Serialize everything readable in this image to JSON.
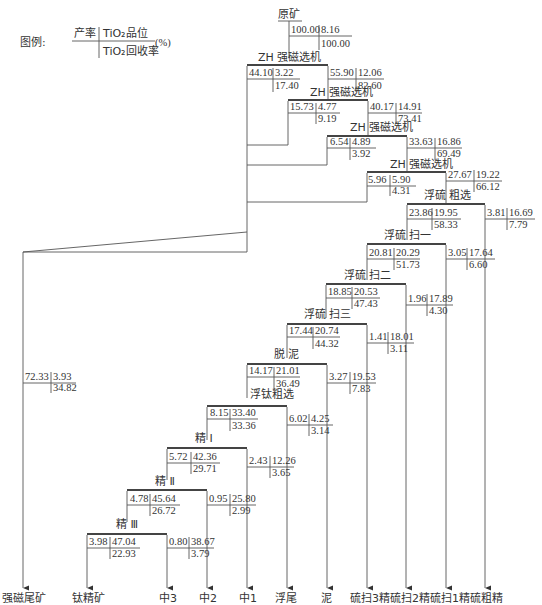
{
  "legend": {
    "prefix": "图例:",
    "yield_label": "产率",
    "grade_label": "TiO₂品位",
    "recovery_label": "TiO₂回收率",
    "unit": "(%)"
  },
  "feed": {
    "label": "原矿",
    "yield": "100.00",
    "grade": "8.16",
    "recovery": "100.00"
  },
  "operations": [
    {
      "id": "mag1",
      "label": "ZH  强磁选机"
    },
    {
      "id": "mag2",
      "label": "ZH  强磁选机"
    },
    {
      "id": "mag3",
      "label": "ZH  强磁选机"
    },
    {
      "id": "mag4",
      "label": "ZH  强磁选机"
    },
    {
      "id": "s_rough",
      "label": "浮硫  粗选"
    },
    {
      "id": "s_scav1",
      "label": "浮硫  扫一"
    },
    {
      "id": "s_scav2",
      "label": "浮硫  扫二"
    },
    {
      "id": "s_scav3",
      "label": "浮硫  扫三"
    },
    {
      "id": "deslime",
      "label": "脱  泥"
    },
    {
      "id": "ti_rough",
      "label": "浮钛粗选"
    },
    {
      "id": "clean1",
      "label": "精  Ⅰ"
    },
    {
      "id": "clean2",
      "label": "精  Ⅱ"
    },
    {
      "id": "clean3",
      "label": "精  Ⅲ"
    }
  ],
  "nodes": [
    {
      "id": "mag1_tail",
      "yield": "44.10",
      "grade": "3.22",
      "recovery": "17.40"
    },
    {
      "id": "mag1_conc",
      "yield": "55.90",
      "grade": "12.06",
      "recovery": "82.60"
    },
    {
      "id": "mag2_tail",
      "yield": "15.73",
      "grade": "4.77",
      "recovery": "9.19"
    },
    {
      "id": "mag2_conc",
      "yield": "40.17",
      "grade": "14.91",
      "recovery": "73.41"
    },
    {
      "id": "mag3_tail",
      "yield": "6.54",
      "grade": "4.89",
      "recovery": "3.92"
    },
    {
      "id": "mag3_conc",
      "yield": "33.63",
      "grade": "16.86",
      "recovery": "69.49"
    },
    {
      "id": "mag4_tail",
      "yield": "5.96",
      "grade": "5.90",
      "recovery": "4.31"
    },
    {
      "id": "mag4_conc",
      "yield": "27.67",
      "grade": "19.22",
      "recovery": "66.12"
    },
    {
      "id": "s_rough_tail",
      "yield": "23.86",
      "grade": "19.95",
      "recovery": "58.33"
    },
    {
      "id": "s_rough_conc",
      "yield": "3.81",
      "grade": "16.69",
      "recovery": "7.79"
    },
    {
      "id": "s_scav1_tail",
      "yield": "20.81",
      "grade": "20.29",
      "recovery": "51.73"
    },
    {
      "id": "s_scav1_conc",
      "yield": "3.05",
      "grade": "17.64",
      "recovery": "6.60"
    },
    {
      "id": "s_scav2_tail",
      "yield": "18.85",
      "grade": "20.53",
      "recovery": "47.43"
    },
    {
      "id": "s_scav2_conc",
      "yield": "1.96",
      "grade": "17.89",
      "recovery": "4.30"
    },
    {
      "id": "s_scav3_tail",
      "yield": "17.44",
      "grade": "20.74",
      "recovery": "44.32"
    },
    {
      "id": "s_scav3_conc",
      "yield": "1.41",
      "grade": "18.01",
      "recovery": "3.11"
    },
    {
      "id": "deslime_under",
      "yield": "14.17",
      "grade": "21.01",
      "recovery": "36.49"
    },
    {
      "id": "deslime_slime",
      "yield": "3.27",
      "grade": "19.53",
      "recovery": "7.83"
    },
    {
      "id": "ti_rough_conc",
      "yield": "8.15",
      "grade": "33.40",
      "recovery": "33.36"
    },
    {
      "id": "ti_rough_tail",
      "yield": "6.02",
      "grade": "4.25",
      "recovery": "3.14"
    },
    {
      "id": "clean1_conc",
      "yield": "5.72",
      "grade": "42.36",
      "recovery": "29.71"
    },
    {
      "id": "clean1_tail",
      "yield": "2.43",
      "grade": "12.26",
      "recovery": "3.65"
    },
    {
      "id": "clean2_conc",
      "yield": "4.78",
      "grade": "45.64",
      "recovery": "26.72"
    },
    {
      "id": "clean2_tail",
      "yield": "0.95",
      "grade": "25.80",
      "recovery": "2.99"
    },
    {
      "id": "clean3_conc",
      "yield": "3.98",
      "grade": "47.04",
      "recovery": "22.93"
    },
    {
      "id": "clean3_tail",
      "yield": "0.80",
      "grade": "38.67",
      "recovery": "3.79"
    },
    {
      "id": "mag_tail_total",
      "yield": "72.33",
      "grade": "3.93",
      "recovery": "34.82"
    }
  ],
  "products": [
    {
      "id": "mag_tailings",
      "label": "强磁尾矿"
    },
    {
      "id": "ti_conc",
      "label": "钛精矿"
    },
    {
      "id": "mid3",
      "label": "中3"
    },
    {
      "id": "mid2",
      "label": "中2"
    },
    {
      "id": "mid1",
      "label": "中1"
    },
    {
      "id": "flot_tail",
      "label": "浮尾"
    },
    {
      "id": "slime",
      "label": "泥"
    },
    {
      "id": "s_scav3_conc",
      "label": "硫扫3精"
    },
    {
      "id": "s_scav2_conc",
      "label": "硫扫2精"
    },
    {
      "id": "s_scav1_conc",
      "label": "硫扫1精"
    },
    {
      "id": "s_rough_conc",
      "label": "硫粗精"
    }
  ]
}
